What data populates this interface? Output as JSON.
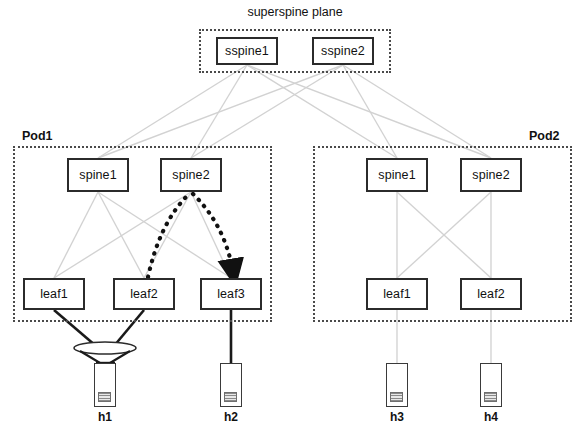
{
  "diagram": {
    "title": "superspine plane",
    "background_color": "#ffffff",
    "link_colors": {
      "fabric_link": "#d2d2d2",
      "host_link": "#1a1a1a",
      "flow_path": "#111111"
    },
    "superspine_plane": {
      "label": "superspine plane",
      "nodes": [
        {
          "label": "sspine1",
          "x": 216,
          "y": 37,
          "w": 62,
          "h": 28
        },
        {
          "label": "sspine2",
          "x": 312,
          "y": 37,
          "w": 62,
          "h": 28
        }
      ],
      "box": {
        "x": 199,
        "y": 29,
        "w": 192,
        "h": 44
      }
    },
    "pods": [
      {
        "label": "Pod1",
        "label_align": "left",
        "box": {
          "x": 13,
          "y": 146,
          "w": 259,
          "h": 176
        },
        "spines": [
          {
            "label": "spine1",
            "x": 67,
            "y": 158,
            "w": 62,
            "h": 34
          },
          {
            "label": "spine2",
            "x": 160,
            "y": 158,
            "w": 62,
            "h": 34
          }
        ],
        "leaves": [
          {
            "label": "leaf1",
            "x": 23,
            "y": 278,
            "w": 62,
            "h": 32
          },
          {
            "label": "leaf2",
            "x": 113,
            "y": 278,
            "w": 62,
            "h": 32
          },
          {
            "label": "leaf3",
            "x": 200,
            "y": 278,
            "w": 62,
            "h": 32
          }
        ]
      },
      {
        "label": "Pod2",
        "label_align": "right",
        "box": {
          "x": 313,
          "y": 146,
          "w": 259,
          "h": 176
        },
        "spines": [
          {
            "label": "spine1",
            "x": 366,
            "y": 158,
            "w": 62,
            "h": 34
          },
          {
            "label": "spine2",
            "x": 460,
            "y": 158,
            "w": 62,
            "h": 34
          }
        ],
        "leaves": [
          {
            "label": "leaf1",
            "x": 366,
            "y": 278,
            "w": 62,
            "h": 32
          },
          {
            "label": "leaf2",
            "x": 460,
            "y": 278,
            "w": 62,
            "h": 32
          }
        ]
      }
    ],
    "hosts": [
      {
        "label": "h1",
        "x": 94,
        "y": 363,
        "attachment": "lag"
      },
      {
        "label": "h2",
        "x": 220,
        "y": 363,
        "attachment": "single"
      },
      {
        "label": "h3",
        "x": 386,
        "y": 363,
        "attachment": "single"
      },
      {
        "label": "h4",
        "x": 480,
        "y": 363,
        "attachment": "single"
      }
    ],
    "lag_marker": {
      "cx": 105,
      "cy": 348,
      "rx": 31,
      "ry": 6
    },
    "flow_path": {
      "description": "leaf2 to spine2 to leaf3",
      "from": "leaf2",
      "via": "spine2",
      "to": "leaf3",
      "style": "thick-dotted-arrow"
    }
  }
}
